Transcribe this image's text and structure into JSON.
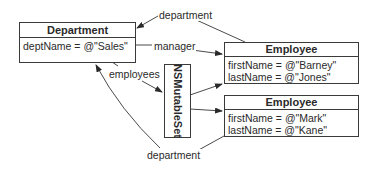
{
  "diagram": {
    "department_entity": {
      "title": "Department",
      "attributes": [
        "deptName = @\"Sales\""
      ]
    },
    "employees": [
      {
        "title": "Employee",
        "attributes": [
          "firstName = @\"Barney\"",
          "lastName = @\"Jones\""
        ]
      },
      {
        "title": "Employee",
        "attributes": [
          "firstName = @\"Mark\"",
          "lastName = @\"Kane\""
        ]
      }
    ],
    "set_object": {
      "title": "NSMutableSet"
    },
    "relationships": {
      "department_top": "department",
      "manager": "manager",
      "employees": "employees",
      "department_bottom": "department"
    }
  }
}
